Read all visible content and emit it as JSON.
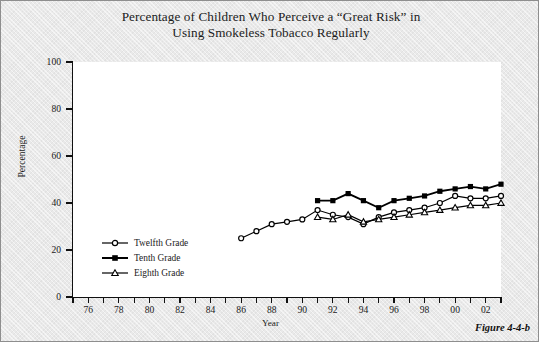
{
  "figure": {
    "title": "Percentage of Children Who Perceive a “Great Risk” in Using Smokeless Tobacco Regularly",
    "title_line1": "Percentage of Children Who Perceive a “Great Risk” in",
    "title_line2": "Using Smokeless Tobacco Regularly",
    "caption": "Figure 4-4-b"
  },
  "chart_data": {
    "type": "line",
    "title": "Percentage of Children Who Perceive a “Great Risk” in Using Smokeless Tobacco Regularly",
    "xlabel": "Year",
    "ylabel": "Percentage",
    "xlim": [
      1975,
      2003
    ],
    "ylim": [
      0,
      100
    ],
    "yticks": [
      0,
      20,
      40,
      60,
      80,
      100
    ],
    "ytick_labels": [
      "0",
      "20",
      "40",
      "60",
      "80",
      "100"
    ],
    "xticks": [
      1975,
      1976,
      1977,
      1978,
      1979,
      1980,
      1981,
      1982,
      1983,
      1984,
      1985,
      1986,
      1987,
      1988,
      1989,
      1990,
      1991,
      1992,
      1993,
      1994,
      1995,
      1996,
      1997,
      1998,
      1999,
      2000,
      2001,
      2002,
      2003
    ],
    "xtick_labels_shown": [
      "76",
      "78",
      "80",
      "82",
      "84",
      "86",
      "88",
      "90",
      "92",
      "94",
      "96",
      "98",
      "00",
      "02"
    ],
    "xtick_label_years": [
      1976,
      1978,
      1980,
      1982,
      1984,
      1986,
      1988,
      1990,
      1992,
      1994,
      1996,
      1998,
      2000,
      2002
    ],
    "grid": false,
    "legend_position": "lower-left-inside",
    "series": [
      {
        "name": "Twelfth Grade",
        "marker": "open-circle",
        "color": "#000000",
        "x": [
          1986,
          1987,
          1988,
          1989,
          1990,
          1991,
          1992,
          1993,
          1994,
          1995,
          1996,
          1997,
          1998,
          1999,
          2000,
          2001,
          2002,
          2003
        ],
        "values": [
          25,
          28,
          31,
          32,
          33,
          37,
          35,
          34,
          31,
          34,
          36,
          37,
          38,
          40,
          43,
          42,
          42,
          43
        ]
      },
      {
        "name": "Tenth Grade",
        "marker": "filled-square",
        "color": "#000000",
        "x": [
          1991,
          1992,
          1993,
          1994,
          1995,
          1996,
          1997,
          1998,
          1999,
          2000,
          2001,
          2002,
          2003
        ],
        "values": [
          41,
          41,
          44,
          41,
          38,
          41,
          42,
          43,
          45,
          46,
          47,
          46,
          48
        ]
      },
      {
        "name": "Eighth Grade",
        "marker": "open-triangle",
        "color": "#000000",
        "x": [
          1991,
          1992,
          1993,
          1994,
          1995,
          1996,
          1997,
          1998,
          1999,
          2000,
          2001,
          2002,
          2003
        ],
        "values": [
          34,
          33,
          35,
          32,
          33,
          34,
          35,
          36,
          37,
          38,
          39,
          39,
          40
        ]
      }
    ]
  },
  "legend": {
    "items": [
      {
        "label": "Twelfth Grade",
        "marker": "open-circle"
      },
      {
        "label": "Tenth Grade",
        "marker": "filled-square"
      },
      {
        "label": "Eighth Grade",
        "marker": "open-triangle"
      }
    ]
  }
}
